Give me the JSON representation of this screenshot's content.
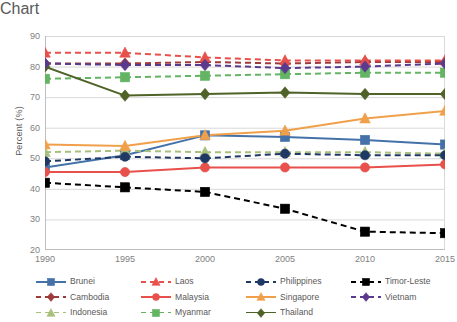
{
  "chart_data": {
    "type": "line",
    "title": "",
    "xlabel": "",
    "ylabel": "Percent (%)",
    "x": [
      1990,
      1995,
      2000,
      2005,
      2010,
      2015
    ],
    "xtick_labels": [
      "1990",
      "1995",
      "2000",
      "2005",
      "2010",
      "2015"
    ],
    "ytick_labels": [
      "20",
      "30",
      "40",
      "50",
      "60",
      "70",
      "80",
      "90"
    ],
    "yticks": [
      20,
      30,
      40,
      50,
      60,
      70,
      80,
      90
    ],
    "ylim": [
      20,
      90
    ],
    "xlim": [
      1990,
      2015
    ],
    "grid": "horizontal",
    "legend_position": "bottom",
    "series": [
      {
        "name": "Brunei",
        "color": "#4472A8",
        "dash": "solid",
        "marker": "square",
        "values": [
          47.0,
          51.0,
          57.5,
          57.0,
          56.0,
          54.5
        ]
      },
      {
        "name": "Cambodia",
        "color": "#9E3A3A",
        "dash": "dashed",
        "marker": "diamond",
        "values": [
          81.0,
          81.0,
          81.5,
          81.0,
          81.5,
          81.5
        ]
      },
      {
        "name": "Indonesia",
        "color": "#A9C07C",
        "dash": "dashed",
        "marker": "triangle",
        "values": [
          52.0,
          52.5,
          52.0,
          52.0,
          52.0,
          51.5
        ]
      },
      {
        "name": "Laos",
        "color": "#E8504B",
        "dash": "dashed",
        "marker": "triangle",
        "values": [
          84.5,
          84.5,
          83.0,
          82.0,
          82.0,
          82.0
        ]
      },
      {
        "name": "Malaysia",
        "color": "#E8504B",
        "dash": "solid",
        "marker": "circle",
        "values": [
          45.5,
          45.5,
          47.0,
          47.0,
          47.0,
          48.0
        ]
      },
      {
        "name": "Myanmar",
        "color": "#63B463",
        "dash": "dashed",
        "marker": "square",
        "values": [
          76.0,
          76.5,
          77.0,
          77.5,
          78.0,
          78.0
        ]
      },
      {
        "name": "Philippines",
        "color": "#1F3864",
        "dash": "dashed",
        "marker": "circle",
        "values": [
          49.0,
          50.5,
          50.0,
          51.5,
          51.0,
          51.0
        ]
      },
      {
        "name": "Singapore",
        "color": "#F0A04B",
        "dash": "solid",
        "marker": "triangle",
        "values": [
          54.5,
          54.0,
          57.5,
          59.0,
          63.0,
          65.5
        ]
      },
      {
        "name": "Thailand",
        "color": "#4F6228",
        "dash": "solid",
        "marker": "diamond",
        "values": [
          80.0,
          70.5,
          71.0,
          71.5,
          71.0,
          71.0
        ]
      },
      {
        "name": "Timor-Leste",
        "color": "#000000",
        "dash": "dashed",
        "marker": "square",
        "values": [
          42.0,
          40.5,
          39.0,
          33.5,
          26.0,
          25.5
        ]
      },
      {
        "name": "Vietnam",
        "color": "#5B3A8E",
        "dash": "dashed",
        "marker": "diamond",
        "values": [
          81.0,
          80.5,
          80.5,
          79.5,
          80.0,
          81.0
        ]
      }
    ]
  }
}
